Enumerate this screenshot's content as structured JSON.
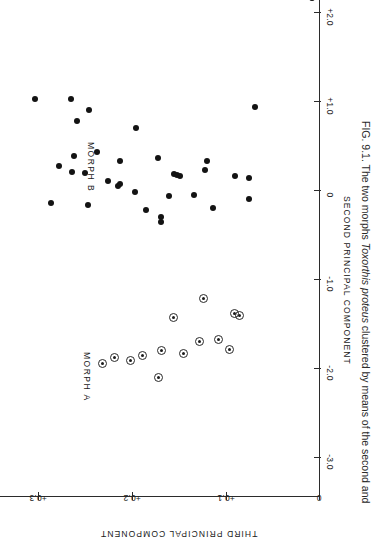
{
  "figure": {
    "caption_prefix": "FIG. 9.1.",
    "caption_part1": " The two morphs ",
    "caption_species": "Toxorthis proteus",
    "caption_part2": " clustered by means of the second and"
  },
  "axes": {
    "x_title": "SECOND  PRINCIPAL   COMPONENT",
    "y_title": "THIRD PRINCIPAL COMPONENT",
    "x_ticks": [
      "+2.0",
      "+1.0",
      "0",
      "-1.0",
      "-2.0",
      "-3.0"
    ],
    "y_ticks": [
      "+0.3",
      "+0.2",
      "+0.1",
      "0"
    ]
  },
  "groups": {
    "morph_a_label": "MORPH  A",
    "morph_b_label": "MORPH  B",
    "morph_a_marker": "open-circle-with-center-dot",
    "morph_b_marker": "filled-circle"
  },
  "chart_data": {
    "type": "scatter",
    "xlabel": "SECOND  PRINCIPAL   COMPONENT",
    "ylabel": "THIRD PRINCIPAL COMPONENT",
    "xlim": [
      -3.0,
      2.3
    ],
    "ylim": [
      0.0,
      0.33
    ],
    "grid": false,
    "legend": "in-plot text labels",
    "series": [
      {
        "name": "MORPH B",
        "marker": "filled-circle",
        "color": "#131313",
        "points": [
          [
            2.16,
            0.007
          ],
          [
            1.02,
            0.303
          ],
          [
            1.02,
            0.265
          ],
          [
            0.9,
            0.245
          ],
          [
            0.93,
            0.068
          ],
          [
            0.78,
            0.258
          ],
          [
            0.7,
            0.195
          ],
          [
            0.43,
            0.237
          ],
          [
            0.38,
            0.262
          ],
          [
            0.36,
            0.172
          ],
          [
            0.33,
            0.212
          ],
          [
            0.33,
            0.12
          ],
          [
            0.27,
            0.277
          ],
          [
            0.23,
            0.122
          ],
          [
            0.2,
            0.264
          ],
          [
            0.19,
            0.25
          ],
          [
            0.18,
            0.155
          ],
          [
            0.17,
            0.152
          ],
          [
            0.16,
            0.148
          ],
          [
            0.16,
            0.09
          ],
          [
            0.14,
            0.075
          ],
          [
            0.1,
            0.225
          ],
          [
            0.07,
            0.212
          ],
          [
            0.04,
            0.215
          ],
          [
            -0.02,
            0.196
          ],
          [
            -0.06,
            0.133
          ],
          [
            -0.07,
            0.16
          ],
          [
            -0.1,
            0.075
          ],
          [
            -0.15,
            0.286
          ],
          [
            -0.17,
            0.247
          ],
          [
            -0.2,
            0.113
          ],
          [
            -0.23,
            0.185
          ],
          [
            -0.3,
            0.169
          ],
          [
            -0.36,
            0.169
          ]
        ]
      },
      {
        "name": "MORPH A",
        "marker": "open-circle-with-center-dot",
        "color": "#2a2a2a",
        "points": [
          [
            -1.22,
            0.123
          ],
          [
            -1.39,
            0.09
          ],
          [
            -1.41,
            0.085
          ],
          [
            -1.43,
            0.155
          ],
          [
            -1.68,
            0.107
          ],
          [
            -1.7,
            0.128
          ],
          [
            -1.79,
            0.095
          ],
          [
            -1.8,
            0.168
          ],
          [
            -1.84,
            0.145
          ],
          [
            -1.86,
            0.188
          ],
          [
            -1.88,
            0.218
          ],
          [
            -1.92,
            0.201
          ],
          [
            -1.95,
            0.231
          ],
          [
            -2.11,
            0.171
          ]
        ]
      }
    ]
  }
}
